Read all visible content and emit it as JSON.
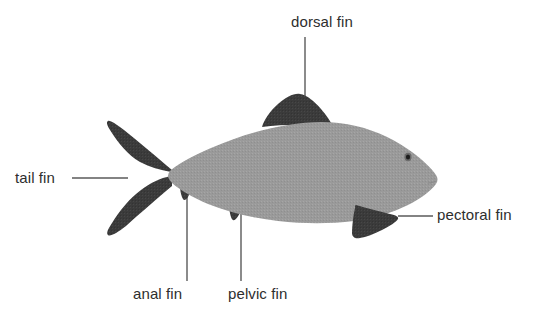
{
  "diagram": {
    "background_color": "#ffffff",
    "body_color": "#9a9a9a",
    "fin_color": "#3b3b3b",
    "leader_color": "#5a5a5a",
    "text_color": "#2e2e2e"
  },
  "labels": {
    "dorsal_fin": "dorsal fin",
    "tail_fin": "tail fin",
    "pectoral_fin": "pectoral fin",
    "anal_fin": "anal fin",
    "pelvic_fin": "pelvic fin"
  },
  "parts": [
    {
      "name": "dorsal fin",
      "label": "dorsal fin",
      "color": "#3b3b3b"
    },
    {
      "name": "tail fin",
      "label": "tail fin",
      "color": "#3b3b3b"
    },
    {
      "name": "pectoral fin",
      "label": "pectoral fin",
      "color": "#3b3b3b"
    },
    {
      "name": "anal fin",
      "label": "anal fin",
      "color": "#3b3b3b"
    },
    {
      "name": "pelvic fin",
      "label": "pelvic fin",
      "color": "#3b3b3b"
    },
    {
      "name": "body",
      "label": "",
      "color": "#9a9a9a"
    },
    {
      "name": "eye",
      "label": "",
      "color": "#1a1a1a"
    }
  ]
}
